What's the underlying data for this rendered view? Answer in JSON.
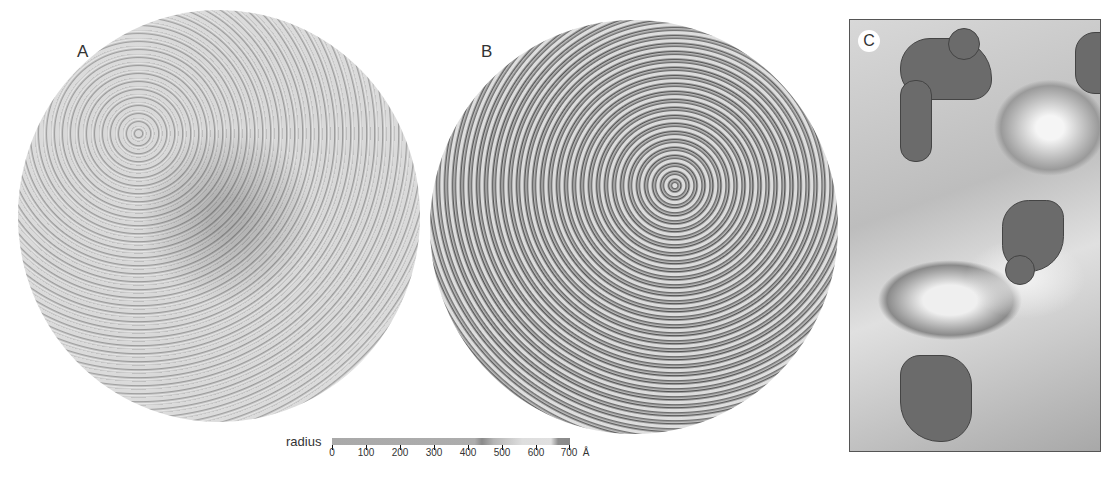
{
  "figure": {
    "panels": [
      {
        "label": "A",
        "description": "Surface rendering of icosahedral virus capsid, uniform light gray"
      },
      {
        "label": "B",
        "description": "Surface rendering of capsid with additional dark gray density"
      },
      {
        "label": "C",
        "description": "Close-up of surface showing dark gray density bound to light gray capsid proteins"
      }
    ],
    "colorbar": {
      "title": "radius",
      "ticks": [
        "0",
        "100",
        "200",
        "300",
        "400",
        "500",
        "600",
        "700"
      ],
      "unit": "Å",
      "range": [
        0,
        700
      ]
    }
  }
}
